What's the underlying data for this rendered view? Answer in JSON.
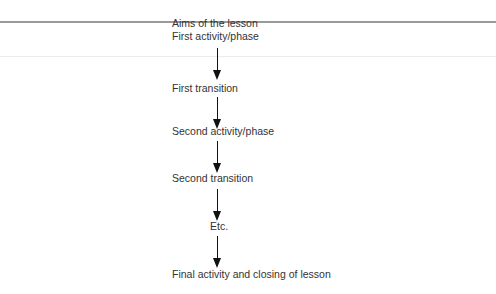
{
  "diagram": {
    "type": "flowchart",
    "direction": "top-to-bottom",
    "header_label": "Aims of the lesson",
    "steps": [
      {
        "label": "First activity/phase"
      },
      {
        "label": "First transition"
      },
      {
        "label": "Second activity/phase"
      },
      {
        "label": "Second transition"
      },
      {
        "label": "Etc."
      },
      {
        "label": "Final activity and closing of lesson"
      }
    ],
    "arrow_color": "#111111",
    "rule_color": "#9a9a9a"
  }
}
